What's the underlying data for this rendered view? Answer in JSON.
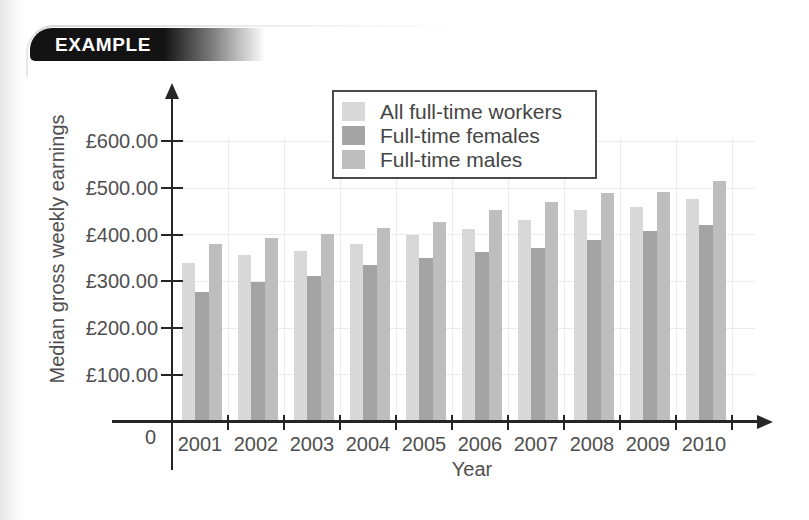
{
  "banner": {
    "label": "EXAMPLE"
  },
  "chart_data": {
    "type": "bar",
    "title": "",
    "xlabel": "Year",
    "ylabel": "Median gross weekly earnings",
    "origin_label": "0",
    "categories": [
      "2001",
      "2002",
      "2003",
      "2004",
      "2005",
      "2006",
      "2007",
      "2008",
      "2009",
      "2010"
    ],
    "series": [
      {
        "name": "All full-time workers",
        "color": "#d8d8d8",
        "values": [
          340,
          357,
          366,
          380,
          399,
          413,
          431,
          453,
          459,
          476
        ]
      },
      {
        "name": "Full-time females",
        "color": "#a4a4a4",
        "values": [
          278,
          298,
          312,
          336,
          350,
          362,
          371,
          389,
          408,
          421
        ]
      },
      {
        "name": "Full-time males",
        "color": "#bebebe",
        "values": [
          380,
          392,
          401,
          415,
          428,
          453,
          471,
          490,
          492,
          514
        ]
      }
    ],
    "y_ticks": [
      {
        "value": 100,
        "label": "£100.00"
      },
      {
        "value": 200,
        "label": "£200.00"
      },
      {
        "value": 300,
        "label": "£300.00"
      },
      {
        "value": 400,
        "label": "£400.00"
      },
      {
        "value": 500,
        "label": "£500.00"
      },
      {
        "value": 600,
        "label": "£600.00"
      }
    ],
    "ylim": [
      0,
      660
    ],
    "grid": true,
    "legend_position": "top-center-right"
  },
  "colors": {
    "banner_bg": "#131313",
    "banner_text": "#ffffff",
    "axis": "#262626",
    "label_text": "#4f4f4f",
    "grid": "#ececec",
    "legend_border": "#4a4a4a"
  }
}
